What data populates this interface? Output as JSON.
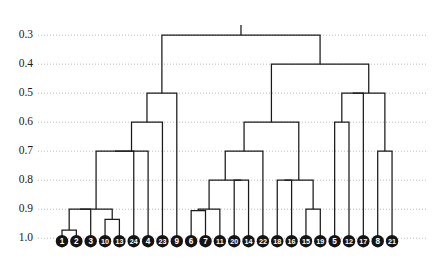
{
  "chart_data": {
    "type": "dendrogram",
    "title": "",
    "xlabel": "",
    "ylabel": "",
    "orientation": "vertical",
    "axis_inverted": true,
    "ylim": [
      1.02,
      0.265
    ],
    "grid": true,
    "grid_axis": "y",
    "legend": "none",
    "y_ticks": [
      0.3,
      0.4,
      0.5,
      0.6,
      0.7,
      0.8,
      0.9,
      1.0
    ],
    "y_tick_labels": [
      "0.3",
      "0.4",
      "0.5",
      "0.6",
      "0.7",
      "0.8",
      "0.9",
      "1.0"
    ],
    "leaf_order": [
      1,
      2,
      3,
      10,
      13,
      24,
      4,
      23,
      9,
      6,
      7,
      11,
      20,
      14,
      22,
      18,
      16,
      15,
      19,
      5,
      12,
      17,
      8,
      21
    ],
    "leaf_labels": [
      "1",
      "2",
      "3",
      "10",
      "13",
      "24",
      "4",
      "23",
      "9",
      "6",
      "7",
      "11",
      "20",
      "14",
      "22",
      "18",
      "16",
      "15",
      "19",
      "5",
      "12",
      "17",
      "8",
      "21"
    ],
    "leaf_baseline": 1.0,
    "n_leaves": 24,
    "merges": [
      {
        "id": "m1",
        "left": "1",
        "right": "2",
        "height": 0.972
      },
      {
        "id": "m2",
        "left": "10",
        "right": "13",
        "height": 0.935
      },
      {
        "id": "m3",
        "left": "m1",
        "right": "3",
        "height": 0.9
      },
      {
        "id": "m4",
        "left": "m3",
        "right": "m2",
        "height": 0.9
      },
      {
        "id": "m5",
        "left": "m4",
        "right": "24",
        "height": 0.7
      },
      {
        "id": "m6",
        "left": "m5",
        "right": "4",
        "height": 0.7
      },
      {
        "id": "m7",
        "left": "m6",
        "right": "23",
        "height": 0.6
      },
      {
        "id": "m8",
        "left": "m7",
        "right": "9",
        "height": 0.5
      },
      {
        "id": "m9",
        "left": "6",
        "right": "7",
        "height": 0.905
      },
      {
        "id": "m10",
        "left": "m9",
        "right": "11",
        "height": 0.9
      },
      {
        "id": "m11",
        "left": "20",
        "right": "14",
        "height": 0.8
      },
      {
        "id": "m12",
        "left": "m10",
        "right": "m11",
        "height": 0.8
      },
      {
        "id": "m13",
        "left": "m12",
        "right": "22",
        "height": 0.7
      },
      {
        "id": "m14",
        "left": "18",
        "right": "16",
        "height": 0.8
      },
      {
        "id": "m15",
        "left": "15",
        "right": "19",
        "height": 0.9
      },
      {
        "id": "m16",
        "left": "m14",
        "right": "m15",
        "height": 0.8
      },
      {
        "id": "m17",
        "left": "m13",
        "right": "m16",
        "height": 0.6
      },
      {
        "id": "m18",
        "left": "5",
        "right": "12",
        "height": 0.6
      },
      {
        "id": "m19",
        "left": "m18",
        "right": "17",
        "height": 0.5
      },
      {
        "id": "m20",
        "left": "8",
        "right": "21",
        "height": 0.7
      },
      {
        "id": "m21",
        "left": "m19",
        "right": "m20",
        "height": 0.5
      },
      {
        "id": "m22",
        "left": "m17",
        "right": "m21",
        "height": 0.4
      },
      {
        "id": "m23",
        "left": "m8",
        "right": "m22",
        "height": 0.3
      }
    ],
    "root": "m23",
    "root_stem_top": 0.265
  },
  "style": {
    "line_color": "#1a1a1a",
    "grid_color": "#aaaaaa",
    "badge_fill": "#141414",
    "badge_text_color": "#ffffff",
    "background": "#ffffff"
  }
}
